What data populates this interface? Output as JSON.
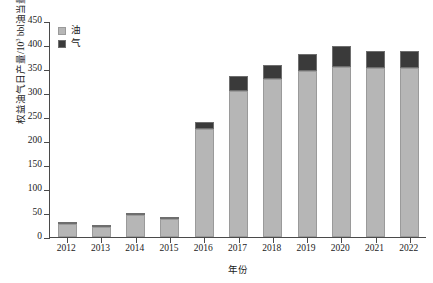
{
  "chart_data": {
    "type": "bar",
    "stacked": true,
    "title": "",
    "xlabel": "年份",
    "ylabel": "权益油气日产量/10³ bbl油当量",
    "ylabel_prefix": "权益油气日产量/10",
    "ylabel_exponent": "3",
    "ylabel_suffix": " bbl油当量",
    "categories": [
      "2012",
      "2013",
      "2014",
      "2015",
      "2016",
      "2017",
      "2018",
      "2019",
      "2020",
      "2021",
      "2022"
    ],
    "series": [
      {
        "name": "油",
        "color": "#b6b6b6",
        "values": [
          28,
          21,
          46,
          38,
          225,
          305,
          330,
          345,
          355,
          353,
          352
        ]
      },
      {
        "name": "气",
        "color": "#3a3a3a",
        "values": [
          2,
          1,
          2,
          2,
          15,
          30,
          28,
          37,
          42,
          35,
          35
        ]
      }
    ],
    "totals": [
      30,
      22,
      48,
      40,
      240,
      335,
      358,
      382,
      397,
      388,
      387
    ],
    "ylim": [
      0,
      450
    ],
    "yticks": [
      0,
      50,
      100,
      150,
      200,
      250,
      300,
      350,
      400,
      450
    ],
    "ytick_labels": [
      "0",
      "50",
      "100",
      "150",
      "200",
      "250",
      "300",
      "350",
      "400",
      "450"
    ],
    "grid": false,
    "legend_position": "top-left",
    "legend": [
      "油",
      "气"
    ]
  }
}
